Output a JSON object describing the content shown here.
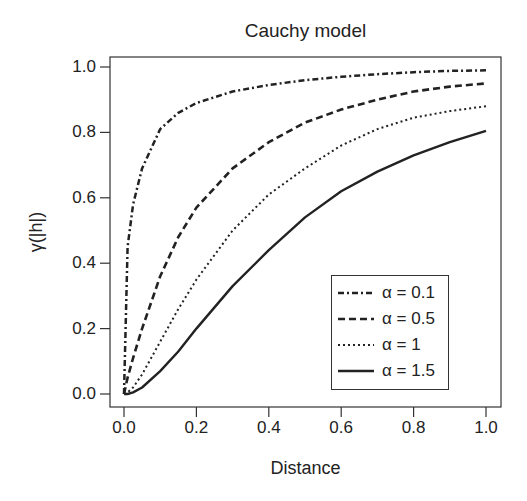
{
  "chart_data": {
    "type": "line",
    "title": "Cauchy model",
    "xlabel": "Distance",
    "ylabel": "γ(|h|)",
    "xlim": [
      0,
      1
    ],
    "ylim": [
      0,
      1
    ],
    "xticks": [
      "0.0",
      "0.2",
      "0.4",
      "0.6",
      "0.8",
      "1.0"
    ],
    "yticks": [
      "0.0",
      "0.2",
      "0.4",
      "0.6",
      "0.8",
      "1.0"
    ],
    "grid": false,
    "legend_position": "lower right",
    "x": [
      0,
      0.01,
      0.025,
      0.05,
      0.1,
      0.15,
      0.2,
      0.3,
      0.4,
      0.5,
      0.6,
      0.7,
      0.8,
      0.9,
      1.0
    ],
    "series": [
      {
        "name": "α = 0.1",
        "style": "dashdot",
        "values": [
          0,
          0.45,
          0.58,
          0.69,
          0.81,
          0.86,
          0.89,
          0.925,
          0.945,
          0.96,
          0.97,
          0.978,
          0.984,
          0.988,
          0.99
        ]
      },
      {
        "name": "α = 0.5",
        "style": "dashed",
        "values": [
          0,
          0.05,
          0.11,
          0.2,
          0.36,
          0.48,
          0.57,
          0.69,
          0.77,
          0.83,
          0.87,
          0.9,
          0.925,
          0.94,
          0.95
        ]
      },
      {
        "name": "α = 1",
        "style": "dotted",
        "values": [
          0,
          0.005,
          0.02,
          0.06,
          0.16,
          0.26,
          0.35,
          0.5,
          0.61,
          0.69,
          0.76,
          0.81,
          0.845,
          0.865,
          0.88
        ]
      },
      {
        "name": "α = 1.5",
        "style": "solid",
        "values": [
          0,
          0.0,
          0.005,
          0.02,
          0.07,
          0.13,
          0.2,
          0.33,
          0.44,
          0.54,
          0.62,
          0.68,
          0.73,
          0.77,
          0.805
        ]
      }
    ]
  }
}
